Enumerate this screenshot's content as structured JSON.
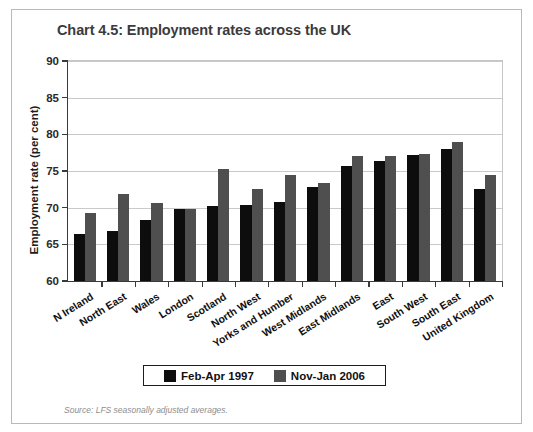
{
  "figure": {
    "title": "Chart 4.5: Employment rates across the UK",
    "source_note": "Source: LFS seasonally adjusted averages.",
    "cropped_header_text": ""
  },
  "legend": {
    "entries": [
      {
        "label": "Feb-Apr 1997",
        "color": "#0d0d0d"
      },
      {
        "label": "Nov-Jan 2006",
        "color": "#4f4f4f"
      }
    ]
  },
  "chart_data": {
    "type": "bar",
    "title": "Chart 4.5: Employment rates across the UK",
    "xlabel": "",
    "ylabel": "Employment rate (per cent)",
    "ylim": [
      60,
      90
    ],
    "yticks": [
      60,
      65,
      70,
      75,
      80,
      85,
      90
    ],
    "grid": true,
    "legend_position": "bottom",
    "categories": [
      "N Ireland",
      "North East",
      "Wales",
      "London",
      "Scotland",
      "North West",
      "Yorks and Humber",
      "West Midlands",
      "East Midlands",
      "East",
      "South West",
      "South East",
      "United Kingdom"
    ],
    "series": [
      {
        "name": "Feb-Apr 1997",
        "color": "#0d0d0d",
        "values": [
          66.4,
          66.8,
          68.3,
          69.8,
          70.2,
          70.4,
          70.8,
          72.8,
          75.7,
          76.3,
          77.2,
          78.0,
          72.6
        ]
      },
      {
        "name": "Nov-Jan 2006",
        "color": "#4f4f4f",
        "values": [
          69.3,
          71.8,
          70.6,
          69.8,
          75.3,
          72.6,
          74.4,
          73.3,
          77.1,
          77.0,
          77.3,
          78.9,
          74.5
        ]
      }
    ]
  }
}
